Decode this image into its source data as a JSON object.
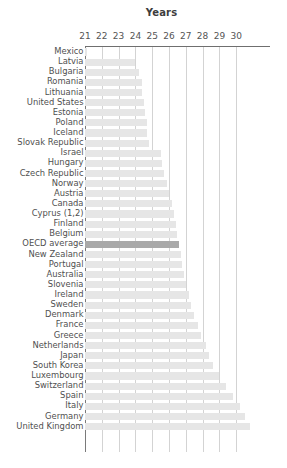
{
  "chart": {
    "title": "Years",
    "axis": {
      "xlabel": "Years",
      "ticks": [
        21,
        22,
        23,
        24,
        25,
        26,
        27,
        28,
        29,
        30
      ],
      "xmin": 20.7,
      "xmax": 31.7
    },
    "colors": {
      "bar": "#e6e6e6",
      "highlight_bar": "#a9a9a9",
      "gridline": "#d3d3d3",
      "axis": "#6f6f6f",
      "text": "#4f4f4f"
    },
    "highlight_category": "OECD average"
  },
  "chart_data": {
    "type": "bar",
    "orientation": "horizontal",
    "title": "Years",
    "xlabel": "Years",
    "ylabel": "",
    "xlim": [
      20.7,
      31.7
    ],
    "xticks": [
      21,
      22,
      23,
      24,
      25,
      26,
      27,
      28,
      29,
      30
    ],
    "grid": true,
    "legend": "none",
    "highlight": "OECD average",
    "categories": [
      "Mexico",
      "Latvia",
      "Bulgaria",
      "Romania",
      "Lithuania",
      "United States",
      "Estonia",
      "Poland",
      "Iceland",
      "Slovak Republic",
      "Israel",
      "Hungary",
      "Czech Republic",
      "Norway",
      "Austria",
      "Canada",
      "Cyprus (1,2)",
      "Finland",
      "Belgium",
      "OECD average",
      "New Zealand",
      "Portugal",
      "Australia",
      "Slovenia",
      "Ireland",
      "Sweden",
      "Denmark",
      "France",
      "Greece",
      "Netherlands",
      "Japan",
      "South Korea",
      "Luxembourg",
      "Switzerland",
      "Spain",
      "Italy",
      "Germany",
      "United Kingdom"
    ],
    "values": [
      21.1,
      24.0,
      24.2,
      24.4,
      24.4,
      24.5,
      24.6,
      24.7,
      24.7,
      24.8,
      25.5,
      25.6,
      25.7,
      25.9,
      26.0,
      26.2,
      26.3,
      26.4,
      26.5,
      26.6,
      26.7,
      26.8,
      26.9,
      27.0,
      27.2,
      27.3,
      27.5,
      27.7,
      27.9,
      28.2,
      28.4,
      28.6,
      29.0,
      29.4,
      29.8,
      30.2,
      30.5,
      30.8
    ]
  }
}
